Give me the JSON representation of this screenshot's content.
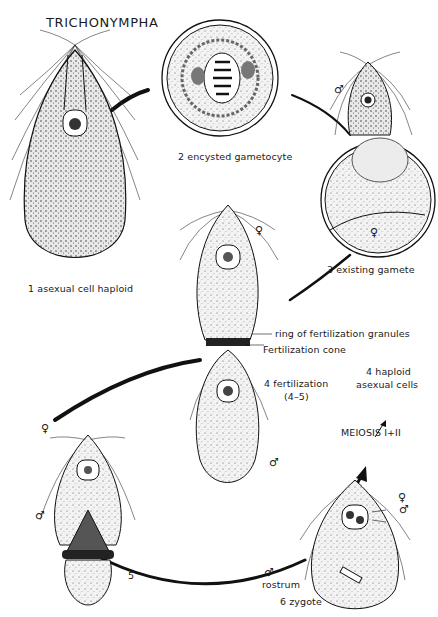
{
  "title": "TRICHONYMPHA",
  "stages": [
    {
      "id": "1",
      "label": "1  asexual cell haploid"
    },
    {
      "id": "2",
      "label": "2  encysted gametocyte"
    },
    {
      "id": "3",
      "label": "3  existing gamete"
    },
    {
      "id": "4",
      "label": "4  fertilization",
      "sublabel": "(4–5)"
    },
    {
      "id": "5",
      "label": "5"
    },
    {
      "id": "6",
      "label": "6 zygote"
    }
  ],
  "annotations": {
    "ring": "ring of fertilization granules",
    "cone": "Fertilization cone",
    "haploid_line1": "4 haploid",
    "haploid_line2": "asexual cells",
    "meiosis": "MEIOSIS I+II",
    "rostrum": "rostrum"
  },
  "symbols": {
    "female": "♀",
    "male": "♂"
  },
  "colors": {
    "ink": "#1a1a1a",
    "paper": "#ffffff",
    "stipple": "#e6e6e6"
  }
}
